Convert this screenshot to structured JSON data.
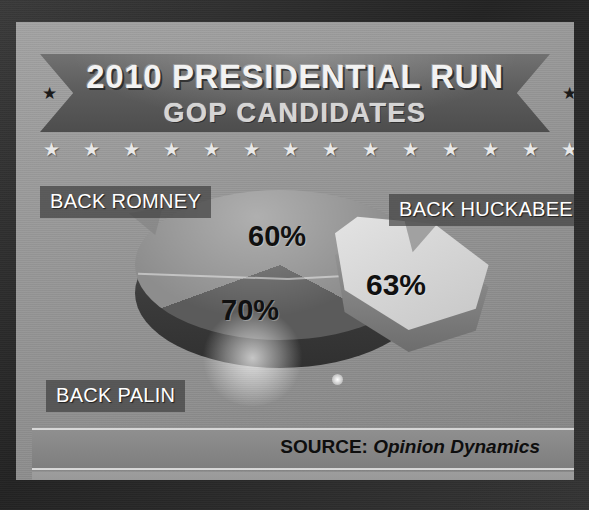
{
  "graphic": {
    "title_main": "2010 PRESIDENTIAL RUN",
    "title_sub": "GOP CANDIDATES",
    "star_glyph": "★",
    "top_star_count": 14,
    "bottom_star_count": 14,
    "source_prefix": "SOURCE:",
    "source_name": "Opinion Dynamics",
    "colors": {
      "frame": "#2c2c2c",
      "panel": "#9a9a9a",
      "ribbon": "#5d5d5d",
      "slice_romney": "#8d8d8d",
      "slice_palin": "#5b5b5b",
      "slice_huckabee": "#d6d6d6",
      "label_box": "rgba(60,60,60,.68)",
      "text_light": "#f2f2f2",
      "text_dark": "#101010"
    }
  },
  "chart_data": {
    "type": "pie",
    "title": "2010 PRESIDENTIAL RUN",
    "subtitle": "GOP CANDIDATES",
    "categories": [
      "BACK ROMNEY",
      "BACK PALIN",
      "BACK HUCKABEE"
    ],
    "values": [
      60,
      70,
      63
    ],
    "value_labels": [
      "60%",
      "70%",
      "63%"
    ],
    "source": "SOURCE: Opinion Dynamics",
    "legend": "inline-callout-labels",
    "slices": [
      {
        "label": "BACK ROMNEY",
        "value": 60,
        "display": "60%",
        "color": "#8d8d8d",
        "exploded": false
      },
      {
        "label": "BACK PALIN",
        "value": 70,
        "display": "70%",
        "color": "#5b5b5b",
        "exploded": false
      },
      {
        "label": "BACK HUCKABEE",
        "value": 63,
        "display": "63%",
        "color": "#d6d6d6",
        "exploded": true
      }
    ]
  }
}
